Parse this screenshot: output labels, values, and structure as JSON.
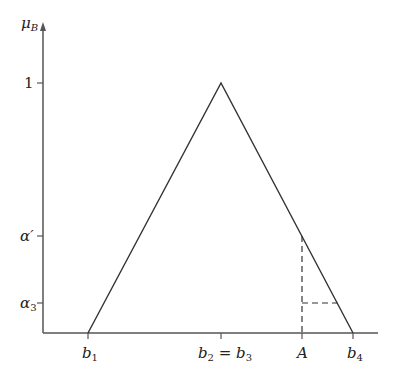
{
  "diagram": {
    "y_axis_label": "μ",
    "y_axis_label_sub": "B",
    "y_ticks": [
      {
        "label": "1",
        "sub": ""
      },
      {
        "label": "α′",
        "sub": ""
      },
      {
        "label": "α",
        "sub": "3"
      }
    ],
    "x_ticks": [
      {
        "label": "b",
        "sub": "1"
      },
      {
        "label": "b",
        "sub": "2",
        "eq": " = ",
        "label2": "b",
        "sub2": "3"
      },
      {
        "label": "A",
        "sub": ""
      },
      {
        "label": "b",
        "sub": "4"
      }
    ],
    "shape": "triangular membership function",
    "line_color": "#333333"
  }
}
